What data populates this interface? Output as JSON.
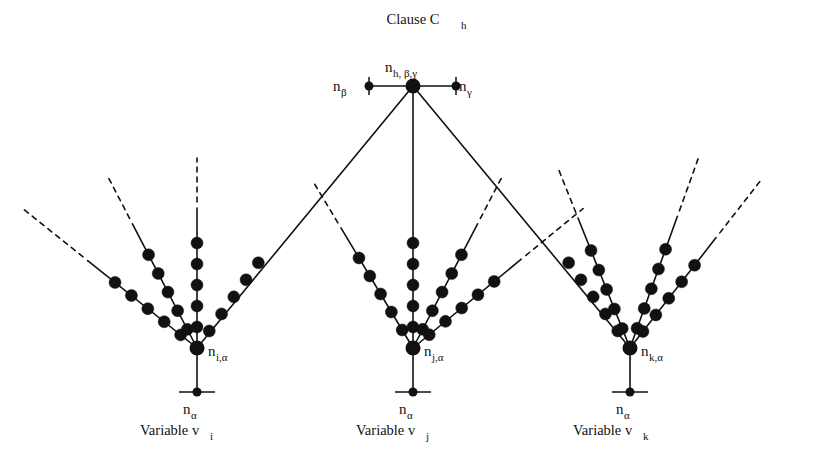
{
  "figure": {
    "title": "Clause C",
    "title_sub": "h",
    "background": "#ffffff",
    "ink": "#111111",
    "width": 818,
    "height": 464
  },
  "clause": {
    "node": {
      "x": 413,
      "y": 86,
      "r": 7.5
    },
    "label_main": "n",
    "label_sub": "h, β,γ",
    "label_x": 385,
    "label_y": 72,
    "left_terminal": {
      "name": "n-beta-node",
      "x": 369,
      "y": 86,
      "r": 4.5,
      "label_main": "n",
      "label_sub": "β",
      "label_x": 333,
      "label_y": 91
    },
    "right_terminal": {
      "name": "n-gamma-node",
      "x": 456,
      "y": 86,
      "r": 4.5,
      "label_main": "n",
      "label_sub": "γ",
      "label_x": 459,
      "label_y": 91
    },
    "tick_half_height": 9
  },
  "variables": [
    {
      "id": "vi",
      "root": {
        "x": 197,
        "y": 348,
        "r": 7.5
      },
      "root_label_main": "n",
      "root_label_sub": "i,α",
      "root_label_x": 208,
      "root_label_y": 356,
      "base": {
        "x": 197,
        "y": 392,
        "r": 4.5
      },
      "base_label_main": "n",
      "base_label_sub": "α",
      "base_label_x": 183,
      "base_label_y": 414,
      "base_tick_half_width": 18,
      "caption": "Variable v",
      "caption_sub": "i",
      "caption_x": 140,
      "caption_y": 435,
      "rays": [
        {
          "name": "ray-outer-left",
          "dx": -1.0,
          "dy": -0.8,
          "beads": 5,
          "spacing": 21,
          "start_offset": 21,
          "solid_len": 140,
          "dash_len": 82,
          "to_clause": false
        },
        {
          "name": "ray-inner-left",
          "dx": -0.52,
          "dy": -1.0,
          "beads": 5,
          "spacing": 21,
          "start_offset": 21,
          "solid_len": 140,
          "dash_len": 55,
          "to_clause": false
        },
        {
          "name": "ray-vertical",
          "dx": 0.0,
          "dy": -1.0,
          "beads": 5,
          "spacing": 21,
          "start_offset": 21,
          "solid_len": 140,
          "dash_len": 50,
          "to_clause": false
        },
        {
          "name": "ray-to-clause",
          "dx": 0.72,
          "dy": -1.0,
          "beads": 5,
          "spacing": 21,
          "start_offset": 21,
          "solid_len": 140,
          "dash_len": 0,
          "to_clause": true
        }
      ]
    },
    {
      "id": "vj",
      "root": {
        "x": 413,
        "y": 348,
        "r": 7.5
      },
      "root_label_main": "n",
      "root_label_sub": "j,α",
      "root_label_x": 424,
      "root_label_y": 356,
      "base": {
        "x": 413,
        "y": 392,
        "r": 4.5
      },
      "base_label_main": "n",
      "base_label_sub": "α",
      "base_label_x": 399,
      "base_label_y": 414,
      "base_tick_half_width": 18,
      "caption": "Variable v",
      "caption_sub": "j",
      "caption_x": 356,
      "caption_y": 435,
      "rays": [
        {
          "name": "ray-outer-left",
          "dx": -0.6,
          "dy": -1.0,
          "beads": 5,
          "spacing": 21,
          "start_offset": 21,
          "solid_len": 140,
          "dash_len": 55,
          "to_clause": false
        },
        {
          "name": "ray-vertical",
          "dx": 0.0,
          "dy": -1.0,
          "beads": 5,
          "spacing": 21,
          "start_offset": 21,
          "solid_len": 262,
          "dash_len": 0,
          "to_clause": true
        },
        {
          "name": "ray-inner-right",
          "dx": 0.52,
          "dy": -1.0,
          "beads": 5,
          "spacing": 21,
          "start_offset": 21,
          "solid_len": 140,
          "dash_len": 55,
          "to_clause": false
        },
        {
          "name": "ray-outer-right",
          "dx": 1.0,
          "dy": -0.82,
          "beads": 5,
          "spacing": 21,
          "start_offset": 21,
          "solid_len": 140,
          "dash_len": 80,
          "to_clause": false
        }
      ]
    },
    {
      "id": "vk",
      "root": {
        "x": 630,
        "y": 348,
        "r": 7.5
      },
      "root_label_main": "n",
      "root_label_sub": "k,α",
      "root_label_x": 641,
      "root_label_y": 356,
      "base": {
        "x": 630,
        "y": 392,
        "r": 4.5
      },
      "base_label_main": "n",
      "base_label_sub": "α",
      "base_label_x": 616,
      "base_label_y": 414,
      "base_tick_half_width": 18,
      "caption": "Variable v",
      "caption_sub": "k",
      "caption_x": 573,
      "caption_y": 435,
      "rays": [
        {
          "name": "ray-to-clause",
          "dx": -0.72,
          "dy": -1.0,
          "beads": 5,
          "spacing": 21,
          "start_offset": 21,
          "solid_len": 140,
          "dash_len": 0,
          "to_clause": true
        },
        {
          "name": "ray-inner-left",
          "dx": -0.4,
          "dy": -1.0,
          "beads": 5,
          "spacing": 21,
          "start_offset": 21,
          "solid_len": 140,
          "dash_len": 55,
          "to_clause": false
        },
        {
          "name": "ray-inner-right",
          "dx": 0.36,
          "dy": -1.0,
          "beads": 5,
          "spacing": 21,
          "start_offset": 21,
          "solid_len": 140,
          "dash_len": 62,
          "to_clause": false
        },
        {
          "name": "ray-outer-right",
          "dx": 0.78,
          "dy": -1.0,
          "beads": 5,
          "spacing": 21,
          "start_offset": 21,
          "solid_len": 140,
          "dash_len": 72,
          "to_clause": false
        }
      ]
    }
  ]
}
